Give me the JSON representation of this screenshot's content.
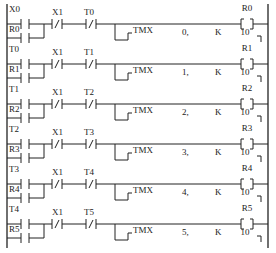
{
  "diagram": {
    "type": "ladder",
    "rungs": [
      {
        "input": "X0",
        "seal": "R0",
        "nc1": "X1",
        "nc2": "T0",
        "timer": "TMX",
        "timer_no": "0,",
        "k_label": "K",
        "k_value": "10",
        "coil": "R0"
      },
      {
        "input": "T0",
        "seal": "R1",
        "nc1": "X1",
        "nc2": "T1",
        "timer": "TMX",
        "timer_no": "1,",
        "k_label": "K",
        "k_value": "10",
        "coil": "R1"
      },
      {
        "input": "T1",
        "seal": "R2",
        "nc1": "X1",
        "nc2": "T2",
        "timer": "TMX",
        "timer_no": "2,",
        "k_label": "K",
        "k_value": "10",
        "coil": "R2"
      },
      {
        "input": "T2",
        "seal": "R3",
        "nc1": "X1",
        "nc2": "T3",
        "timer": "TMX",
        "timer_no": "3,",
        "k_label": "K",
        "k_value": "10",
        "coil": "R3"
      },
      {
        "input": "T3",
        "seal": "R4",
        "nc1": "X1",
        "nc2": "T4",
        "timer": "TMX",
        "timer_no": "4,",
        "k_label": "K",
        "k_value": "10",
        "coil": "R4"
      },
      {
        "input": "T4",
        "seal": "R5",
        "nc1": "X1",
        "nc2": "T5",
        "timer": "TMX",
        "timer_no": "5,",
        "k_label": "K",
        "k_value": "10",
        "coil": "R5"
      }
    ],
    "colors": {
      "line": "#222222",
      "background": "#ffffff"
    }
  }
}
